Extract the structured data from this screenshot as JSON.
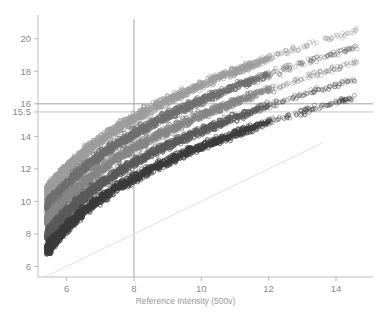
{
  "chart_data": {
    "type": "scatter",
    "title": "",
    "subtitle": "",
    "xlabel": "Reference Intensity (500v)",
    "ylabel": "",
    "xlim": [
      5.15,
      15.1
    ],
    "ylim": [
      5.35,
      21.4
    ],
    "xticks": [
      6,
      8,
      10,
      12,
      14
    ],
    "yticks": [
      6,
      8,
      10,
      12,
      14,
      15.5,
      16,
      18,
      20
    ],
    "xtick_labels": [
      "6",
      "8",
      "10",
      "12",
      "14"
    ],
    "ytick_labels": [
      "6",
      "8",
      "10",
      "12",
      "14",
      "15.5",
      "16",
      "18",
      "20"
    ],
    "grid": false,
    "legend": false,
    "marker": "open-circle",
    "marker_size": 2.0,
    "annotations": [
      {
        "name": "threshold-line-16",
        "type": "hline",
        "y": 16,
        "color": "#9a9a9a"
      },
      {
        "name": "threshold-line-15-5",
        "type": "hline",
        "y": 15.5,
        "color": "#c0c0c0"
      },
      {
        "name": "reference-line-x8",
        "type": "vline",
        "x": 8,
        "color": "#9a9a9a",
        "y_from": 5.35,
        "y_to": 21.2
      },
      {
        "name": "identity-line",
        "type": "diagonal",
        "x_from": 5.3,
        "y_from": 5.3,
        "x_to": 13.6,
        "y_to": 13.6,
        "color": "#dcdcdc"
      }
    ],
    "series": [
      {
        "name": "Series 1 (lightest)",
        "color": "#9d9d9d",
        "x": [
          5.45,
          5.6,
          5.8,
          6.0,
          6.25,
          6.5,
          6.8,
          7.1,
          7.45,
          7.8,
          8.2,
          8.6,
          9.05,
          9.5,
          10.0,
          10.5,
          11.0,
          11.55,
          12.1,
          12.7,
          13.3,
          13.95,
          14.6
        ],
        "y": [
          10.6,
          11.05,
          11.55,
          12.0,
          12.5,
          12.95,
          13.45,
          13.9,
          14.4,
          14.85,
          15.35,
          15.8,
          16.25,
          16.7,
          17.15,
          17.6,
          18.0,
          18.45,
          18.85,
          19.3,
          19.7,
          20.1,
          20.5
        ]
      },
      {
        "name": "Series 2",
        "color": "#6e6e6e",
        "x": [
          5.45,
          5.6,
          5.8,
          6.0,
          6.25,
          6.5,
          6.8,
          7.1,
          7.45,
          7.8,
          8.2,
          8.6,
          9.05,
          9.5,
          10.0,
          10.5,
          11.0,
          11.55,
          12.1,
          12.7,
          13.3,
          13.95,
          14.6
        ],
        "y": [
          9.7,
          10.15,
          10.6,
          11.05,
          11.55,
          12.0,
          12.5,
          12.95,
          13.45,
          13.9,
          14.4,
          14.85,
          15.3,
          15.75,
          16.2,
          16.6,
          17.05,
          17.45,
          17.9,
          18.3,
          18.7,
          19.1,
          19.5
        ]
      },
      {
        "name": "Series 3",
        "color": "#868686",
        "x": [
          5.45,
          5.6,
          5.8,
          6.0,
          6.25,
          6.5,
          6.8,
          7.1,
          7.45,
          7.8,
          8.2,
          8.6,
          9.05,
          9.5,
          10.0,
          10.5,
          11.0,
          11.55,
          12.1,
          12.7,
          13.3,
          13.95,
          14.6
        ],
        "y": [
          8.85,
          9.3,
          9.75,
          10.2,
          10.7,
          11.15,
          11.65,
          12.1,
          12.6,
          13.05,
          13.5,
          13.95,
          14.4,
          14.85,
          15.3,
          15.7,
          16.1,
          16.55,
          16.95,
          17.35,
          17.75,
          18.15,
          18.55
        ]
      },
      {
        "name": "Series 4",
        "color": "#5a5a5a",
        "x": [
          5.45,
          5.6,
          5.8,
          6.0,
          6.25,
          6.5,
          6.8,
          7.1,
          7.45,
          7.8,
          8.2,
          8.6,
          9.05,
          9.5,
          10.0,
          10.5,
          11.0,
          11.55,
          12.1,
          12.7,
          13.3,
          13.95,
          14.6
        ],
        "y": [
          7.95,
          8.4,
          8.85,
          9.3,
          9.8,
          10.25,
          10.75,
          11.2,
          11.7,
          12.15,
          12.6,
          13.05,
          13.5,
          13.9,
          14.35,
          14.75,
          15.15,
          15.55,
          15.95,
          16.35,
          16.75,
          17.1,
          17.5
        ]
      },
      {
        "name": "Series 5 (darkest)",
        "color": "#3a3a3a",
        "x": [
          5.45,
          5.6,
          5.8,
          6.0,
          6.25,
          6.5,
          6.8,
          7.1,
          7.45,
          7.8,
          8.2,
          8.6,
          9.05,
          9.5,
          10.0,
          10.5,
          11.0,
          11.55,
          12.1,
          12.7,
          13.3,
          13.95,
          14.6
        ],
        "y": [
          7.1,
          7.5,
          7.95,
          8.4,
          8.9,
          9.35,
          9.85,
          10.3,
          10.8,
          11.2,
          11.65,
          12.1,
          12.5,
          12.95,
          13.35,
          13.75,
          14.15,
          14.55,
          14.95,
          15.3,
          15.7,
          16.05,
          16.45
        ]
      }
    ]
  },
  "axes": {
    "frame_color": "#b8b8b8",
    "tick_color": "#b0b0b0",
    "label_color": "#8a8a8a"
  }
}
